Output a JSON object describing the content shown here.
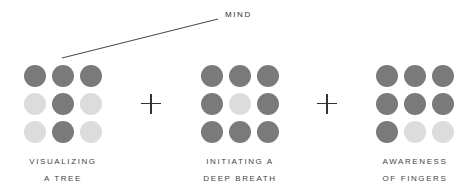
{
  "annotation": {
    "text": "MIND"
  },
  "colors": {
    "dark": "#7a7a7a",
    "light": "#dcdcdc",
    "line": "#444444"
  },
  "operators": [
    "+",
    "+"
  ],
  "groups": [
    {
      "label_line1": "VISUALIZING",
      "label_line2": "A TREE",
      "pattern": [
        [
          1,
          1,
          1
        ],
        [
          0,
          1,
          0
        ],
        [
          0,
          1,
          0
        ]
      ]
    },
    {
      "label_line1": "INITIATING A",
      "label_line2": "DEEP BREATH",
      "pattern": [
        [
          1,
          1,
          1
        ],
        [
          1,
          0,
          1
        ],
        [
          1,
          1,
          1
        ]
      ]
    },
    {
      "label_line1": "AWARENESS",
      "label_line2": "OF FINGERS",
      "pattern": [
        [
          1,
          1,
          1
        ],
        [
          1,
          1,
          1
        ],
        [
          1,
          0,
          0
        ]
      ]
    }
  ]
}
